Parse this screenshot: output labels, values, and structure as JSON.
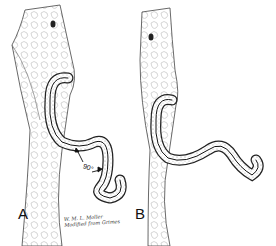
{
  "figure": {
    "panels": [
      {
        "label": "A",
        "annotation": "90°"
      },
      {
        "label": "B"
      }
    ],
    "signature": {
      "line1": "W. M. L. Moller",
      "line2": "Modified from Grimes"
    },
    "colors": {
      "ink": "#111111",
      "shade": "#bdbdbd",
      "background": "#ffffff"
    }
  }
}
